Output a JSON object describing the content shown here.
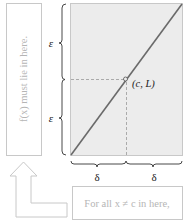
{
  "figure": {
    "left_box_text": "f(x) must lie in here.",
    "bottom_box_text": "For all x ≠ c in here,",
    "epsilon_upper": "ε",
    "epsilon_lower": "ε",
    "delta_left": "δ",
    "delta_right": "δ",
    "point_label": "(c, L)"
  },
  "colors": {
    "plot_fill": "#ececec",
    "line": "#6a6a6a",
    "box_border": "#c8c8c8",
    "faint_text": "#b5b5b5",
    "dark_text": "#222222"
  }
}
